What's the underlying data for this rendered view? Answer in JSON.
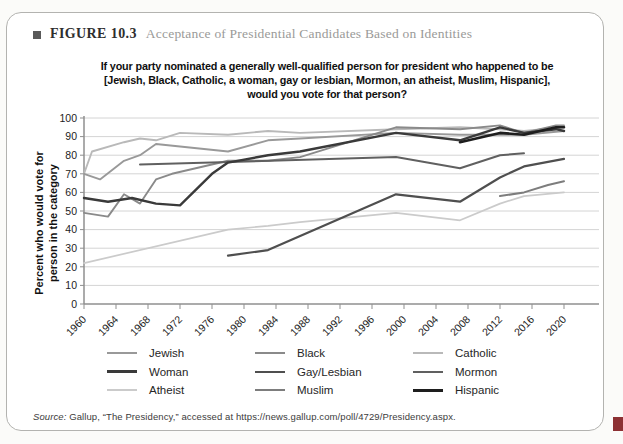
{
  "page": {
    "figure_label": "FIGURE 10.3",
    "figure_title": "Acceptance of Presidential Candidates Based on Identities",
    "source_prefix": "Source:",
    "source_rest": " Gallup, “The Presidency,” accessed at https://news.gallup.com/poll/4729/Presidency.aspx."
  },
  "chart_data": {
    "type": "line",
    "title_lines": [
      "If your party nominated a generally well-qualified person for president who happened to be",
      "[Jewish, Black, Catholic, a woman, gay or lesbian, Mormon, an atheist, Muslim, Hispanic],",
      "would you vote for that person?"
    ],
    "ylabel_lines": [
      "Percent who would vote for",
      "person in the category"
    ],
    "xlim": [
      1960,
      2023
    ],
    "ylim": [
      0,
      100
    ],
    "y_tick_step": 10,
    "x_ticks": [
      1960,
      1964,
      1968,
      1972,
      1976,
      1980,
      1984,
      1988,
      1992,
      1996,
      2000,
      2004,
      2008,
      2012,
      2016,
      2020
    ],
    "grid": "horizontal-only",
    "legend_position": "bottom",
    "axis_color": "#8f8f8f",
    "grid_color": "#d4d4d4",
    "series": [
      {
        "name": "Jewish",
        "color": "#999999",
        "width": 1.9,
        "points": [
          [
            1960,
            70
          ],
          [
            1962,
            67
          ],
          [
            1965,
            77
          ],
          [
            1967,
            80
          ],
          [
            1969,
            86
          ],
          [
            1978,
            82
          ],
          [
            1983,
            88
          ],
          [
            1987,
            89
          ],
          [
            1999,
            92
          ],
          [
            2007,
            91
          ],
          [
            2015,
            91
          ],
          [
            2020,
            93
          ]
        ]
      },
      {
        "name": "Black",
        "color": "#8a8a8a",
        "width": 1.9,
        "points": [
          [
            1960,
            49
          ],
          [
            1963,
            47
          ],
          [
            1965,
            59
          ],
          [
            1967,
            54
          ],
          [
            1969,
            67
          ],
          [
            1971,
            70
          ],
          [
            1978,
            77
          ],
          [
            1983,
            77
          ],
          [
            1987,
            79
          ],
          [
            1999,
            95
          ],
          [
            2007,
            94
          ],
          [
            2012,
            96
          ],
          [
            2015,
            92
          ],
          [
            2019,
            96
          ],
          [
            2020,
            96
          ]
        ]
      },
      {
        "name": "Catholic",
        "color": "#b9b9b9",
        "width": 1.9,
        "points": [
          [
            1960,
            70
          ],
          [
            1961,
            82
          ],
          [
            1965,
            87
          ],
          [
            1967,
            89
          ],
          [
            1969,
            88
          ],
          [
            1972,
            92
          ],
          [
            1978,
            91
          ],
          [
            1983,
            93
          ],
          [
            1987,
            92
          ],
          [
            1999,
            94
          ],
          [
            2007,
            95
          ],
          [
            2012,
            94
          ],
          [
            2015,
            93
          ],
          [
            2020,
            95
          ]
        ]
      },
      {
        "name": "Woman",
        "color": "#3a3a3a",
        "width": 2.4,
        "points": [
          [
            1960,
            57
          ],
          [
            1963,
            55
          ],
          [
            1966,
            57
          ],
          [
            1969,
            54
          ],
          [
            1972,
            53
          ],
          [
            1976,
            70
          ],
          [
            1978,
            76
          ],
          [
            1983,
            80
          ],
          [
            1987,
            82
          ],
          [
            1999,
            92
          ],
          [
            2007,
            88
          ],
          [
            2012,
            95
          ],
          [
            2015,
            92
          ],
          [
            2019,
            94
          ],
          [
            2020,
            93
          ]
        ]
      },
      {
        "name": "Gay/Lesbian",
        "color": "#4f4f4f",
        "width": 2.2,
        "points": [
          [
            1978,
            26
          ],
          [
            1983,
            29
          ],
          [
            1999,
            59
          ],
          [
            2007,
            55
          ],
          [
            2012,
            68
          ],
          [
            2015,
            74
          ],
          [
            2020,
            78
          ]
        ]
      },
      {
        "name": "Mormon",
        "color": "#606060",
        "width": 2.0,
        "points": [
          [
            1967,
            75
          ],
          [
            1999,
            79
          ],
          [
            2007,
            73
          ],
          [
            2012,
            80
          ],
          [
            2015,
            81
          ]
        ]
      },
      {
        "name": "Atheist",
        "color": "#cbcbcb",
        "width": 1.7,
        "points": [
          [
            1960,
            22
          ],
          [
            1978,
            40
          ],
          [
            1983,
            42
          ],
          [
            1987,
            44
          ],
          [
            1999,
            49
          ],
          [
            2007,
            45
          ],
          [
            2012,
            54
          ],
          [
            2015,
            58
          ],
          [
            2020,
            60
          ]
        ]
      },
      {
        "name": "Muslim",
        "color": "#7d7d7d",
        "width": 2.0,
        "points": [
          [
            2012,
            58
          ],
          [
            2015,
            60
          ],
          [
            2018,
            64
          ],
          [
            2020,
            66
          ]
        ]
      },
      {
        "name": "Hispanic",
        "color": "#1e1e1e",
        "width": 2.6,
        "points": [
          [
            2007,
            87
          ],
          [
            2012,
            92
          ],
          [
            2015,
            91
          ],
          [
            2019,
            95
          ],
          [
            2020,
            95
          ]
        ]
      }
    ]
  }
}
